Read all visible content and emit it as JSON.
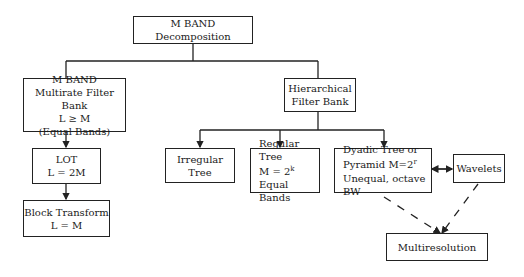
{
  "nodes": {
    "root": {
      "label": "M BAND Decomposition"
    },
    "mband": {
      "lines": [
        "M BAND",
        "Multirate Filter Bank",
        "L ≥ M",
        "(Equal Bands)"
      ]
    },
    "hier": {
      "lines": [
        "Hierarchical",
        "Filter Bank"
      ]
    },
    "lot": {
      "lines": [
        "LOT",
        "L = 2M"
      ]
    },
    "block": {
      "lines": [
        "Block Transform",
        "L = M"
      ]
    },
    "irregular": {
      "label": "Irregular Tree"
    },
    "regular": {
      "line1": "Regular Tree",
      "line2_base": "M = 2",
      "line2_exp": "k",
      "line3": "Equal Bands"
    },
    "dyadic": {
      "line1": "Dyadic Tree or",
      "line2_base": "Pyramid M=2",
      "line2_exp": "r",
      "line3": "Unequal, octave BW"
    },
    "wavelets": {
      "label": "Wavelets"
    },
    "multires": {
      "label": "Multiresolution"
    }
  }
}
